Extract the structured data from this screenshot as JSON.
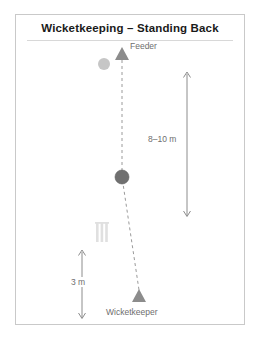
{
  "figure": {
    "title": "Wicketkeeping – Standing Back",
    "type": "field-position-diagram",
    "frame_color": "#c9c9c9",
    "background": "#ffffff"
  },
  "labels": {
    "feeder": "Feeder",
    "wicketkeeper": "Wicketkeeper",
    "distance_long": "8–10 m",
    "distance_short": "3 m"
  },
  "markers": [
    {
      "name": "feeder-marker",
      "shape": "triangle",
      "color": "#8c8c8c",
      "x": 122,
      "y": 54
    },
    {
      "name": "delivery-ball",
      "shape": "circle",
      "color": "#c6c6c6",
      "x": 104,
      "y": 64
    },
    {
      "name": "batter-ball",
      "shape": "circle",
      "color": "#707070",
      "x": 122,
      "y": 177
    },
    {
      "name": "stumps",
      "shape": "three-bars",
      "color": "#e0e0e0",
      "x": 101,
      "y": 232
    },
    {
      "name": "wicketkeeper-marker",
      "shape": "triangle",
      "color": "#8c8c8c",
      "x": 139,
      "y": 296
    }
  ],
  "annotations": {
    "ball_path": {
      "name": "ball-path-dashed-line",
      "style": "dashed",
      "color": "#9a9a9a",
      "points": "122,60 122,177 139,290"
    },
    "arrow_long": {
      "name": "distance-arrow-8-10m",
      "orientation": "vertical",
      "double_headed": true,
      "x": 187,
      "y_top": 72,
      "y_bottom": 216,
      "color": "#8c8c8c"
    },
    "arrow_short": {
      "name": "distance-arrow-3m",
      "orientation": "vertical",
      "double_headed": true,
      "x": 82,
      "y_top": 250,
      "y_bottom": 318,
      "color": "#8c8c8c"
    }
  },
  "colors": {
    "title_text": "#1a1a1a",
    "label_text": "#6e6e6e",
    "marker_dark": "#707070",
    "marker_mid": "#8c8c8c",
    "marker_light": "#c6c6c6",
    "stumps": "#e0e0e0",
    "dashes": "#9a9a9a",
    "frame": "#c9c9c9"
  }
}
